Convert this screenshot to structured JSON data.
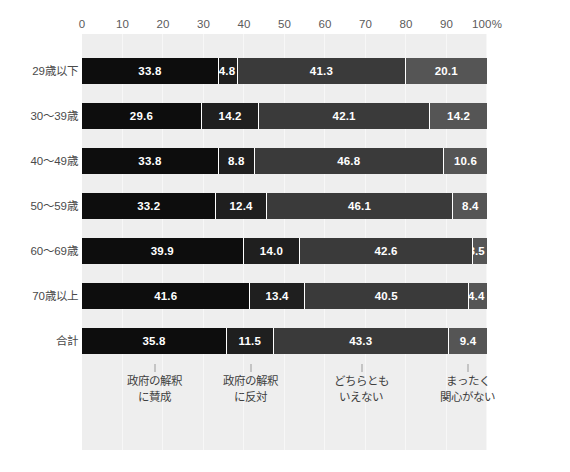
{
  "chart_data": {
    "type": "bar",
    "subtype": "horizontal-stacked-100",
    "title": "",
    "subtitle": "",
    "xlabel": "",
    "ylabel": "",
    "xlim": [
      0,
      100
    ],
    "grid": true,
    "legend_position": "bottom",
    "axis_ticks": [
      {
        "label": "0",
        "value": 0
      },
      {
        "label": "10",
        "value": 10
      },
      {
        "label": "20",
        "value": 20
      },
      {
        "label": "30",
        "value": 30
      },
      {
        "label": "40",
        "value": 40
      },
      {
        "label": "50",
        "value": 50
      },
      {
        "label": "60",
        "value": 60
      },
      {
        "label": "70",
        "value": 70
      },
      {
        "label": "80",
        "value": 80
      },
      {
        "label": "90",
        "value": 90
      },
      {
        "label": "100%",
        "value": 100
      }
    ],
    "categories": [
      "29歳以下",
      "30〜39歳",
      "40〜49歳",
      "50〜59歳",
      "60〜69歳",
      "70歳以上",
      "合計"
    ],
    "series": [
      {
        "name": "政府の解釈に賛成",
        "legend_line1": "政府の解釈",
        "legend_line2": "に賛成",
        "color": "#0d0d0d",
        "values": [
          33.8,
          29.6,
          33.8,
          33.2,
          39.9,
          41.6,
          35.8
        ],
        "labels": [
          "33.8",
          "29.6",
          "33.8",
          "33.2",
          "39.9",
          "41.6",
          "35.8"
        ]
      },
      {
        "name": "政府の解釈に反対",
        "legend_line1": "政府の解釈",
        "legend_line2": "に反対",
        "color": "#1f1f1f",
        "values": [
          4.8,
          14.2,
          8.8,
          12.4,
          14.0,
          13.4,
          11.5
        ],
        "labels": [
          "4.8",
          "14.2",
          "8.8",
          "12.4",
          "14.0",
          "13.4",
          "11.5"
        ]
      },
      {
        "name": "どちらともいえない",
        "legend_line1": "どちらとも",
        "legend_line2": "いえない",
        "color": "#3a3a3a",
        "values": [
          41.3,
          42.1,
          46.8,
          46.1,
          42.6,
          40.5,
          43.3
        ],
        "labels": [
          "41.3",
          "42.1",
          "46.8",
          "46.1",
          "42.6",
          "40.5",
          "43.3"
        ]
      },
      {
        "name": "まったく関心がない",
        "legend_line1": "まったく",
        "legend_line2": "関心がない",
        "color": "#555555",
        "values": [
          20.1,
          14.2,
          10.6,
          8.4,
          3.5,
          4.4,
          9.4
        ],
        "labels": [
          "20.1",
          "14.2",
          "10.6",
          "8.4",
          "3.5",
          "4.4",
          "9.4"
        ]
      }
    ],
    "colors": {
      "plot_background": "#eeeeee",
      "page_background": "#ffffff",
      "gridline": "#f7f7f7",
      "label_text": "#4a4a4a",
      "tick_text": "#5b5b5b",
      "value_text": "#ffffff"
    }
  }
}
